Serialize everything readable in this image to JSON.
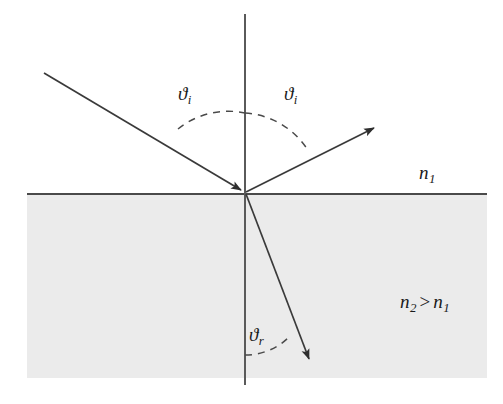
{
  "figure": {
    "labels": {
      "theta_incident_left": {
        "symbol": "ϑ",
        "subscript": "i"
      },
      "theta_incident_right": {
        "symbol": "ϑ",
        "subscript": "i"
      },
      "theta_refracted": {
        "symbol": "ϑ",
        "subscript": "r"
      },
      "index_upper": {
        "symbol": "n",
        "subscript": "1"
      },
      "index_lower_relation": {
        "symbol": "n",
        "subscript": "2",
        "relation": ">",
        "symbol2": "n",
        "subscript2": "1"
      }
    },
    "colors": {
      "line": "#4a4a4a",
      "ray": "#3a3a3a",
      "dashed": "#4a4a4a",
      "medium_upper_fill": "#ffffff",
      "medium_lower_fill": "#ebebeb",
      "text": "#1a1a1a",
      "background": "#ffffff"
    },
    "geometry": {
      "origin": {
        "x": 245,
        "y": 193
      },
      "interface": {
        "x1": 27,
        "y1": 194,
        "x2": 487,
        "y2": 194
      },
      "normal": {
        "x1": 245,
        "y1": 14,
        "x2": 245,
        "y2": 385
      },
      "medium_lower_rect": {
        "x": 27,
        "y": 194,
        "width": 460,
        "height": 184
      },
      "incident_ray": {
        "x1": 44,
        "y1": 73,
        "x2": 245,
        "y2": 193
      },
      "reflected_ray": {
        "x1": 245,
        "y1": 193,
        "x2": 376,
        "y2": 127
      },
      "refracted_ray": {
        "x1": 245,
        "y1": 193,
        "x2": 311,
        "y2": 364
      },
      "arc_incident_radius": 80,
      "arc_refracted_radius": 62
    }
  }
}
